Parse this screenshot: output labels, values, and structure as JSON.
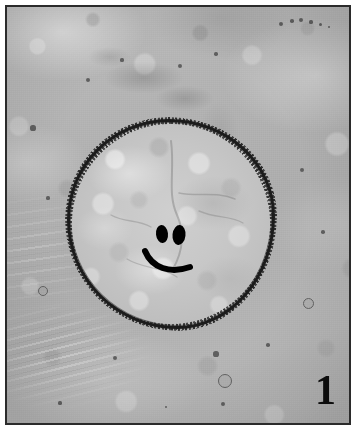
{
  "figure": {
    "number": "1",
    "caption_text": "",
    "medium": "light micrograph, greyscale"
  },
  "image": {
    "width_px": 356,
    "height_px": 430,
    "border_color": "#2b2b2b",
    "page_background": "#ffffff",
    "field_background": "#b3b3b3"
  },
  "subject": {
    "name": "encysted-circular-structure",
    "outline_color": "#1c1c1c",
    "interior_color": "#c6c6c6",
    "bounds": {
      "x": 60,
      "y": 112,
      "w": 208,
      "h": 210
    }
  },
  "markings": {
    "description": "smiley-face",
    "color": "#000000",
    "left_eye": {
      "cx": 160,
      "cy": 232,
      "rx": 6,
      "ry": 9
    },
    "right_eye": {
      "cx": 177,
      "cy": 233,
      "rx": 6.5,
      "ry": 10
    },
    "mouth_path": "M143,249 C150,266 168,272 188,265",
    "mouth_width": 6
  },
  "background_dots": [
    {
      "x": 279,
      "y": 22,
      "r": 2.4
    },
    {
      "x": 290,
      "y": 19,
      "r": 1.8
    },
    {
      "x": 299,
      "y": 18,
      "r": 2.0
    },
    {
      "x": 309,
      "y": 20,
      "r": 1.6
    },
    {
      "x": 318,
      "y": 22,
      "r": 1.5
    },
    {
      "x": 327,
      "y": 25,
      "r": 1.4
    },
    {
      "x": 86,
      "y": 78,
      "r": 2.2
    },
    {
      "x": 120,
      "y": 58,
      "r": 1.6
    },
    {
      "x": 178,
      "y": 64,
      "r": 2.0
    },
    {
      "x": 214,
      "y": 52,
      "r": 1.7
    },
    {
      "x": 31,
      "y": 126,
      "r": 2.6
    },
    {
      "x": 46,
      "y": 196,
      "r": 1.6
    },
    {
      "x": 300,
      "y": 168,
      "r": 2.0
    },
    {
      "x": 321,
      "y": 230,
      "r": 1.8
    },
    {
      "x": 113,
      "y": 356,
      "r": 2.2
    },
    {
      "x": 214,
      "y": 352,
      "r": 2.6
    },
    {
      "x": 221,
      "y": 402,
      "r": 2.0
    },
    {
      "x": 266,
      "y": 343,
      "r": 1.8
    },
    {
      "x": 58,
      "y": 401,
      "r": 1.6
    },
    {
      "x": 164,
      "y": 405,
      "r": 1.4
    }
  ],
  "background_ring_dots": [
    {
      "x": 222,
      "y": 378,
      "r": 6
    },
    {
      "x": 40,
      "y": 288,
      "r": 4
    },
    {
      "x": 305,
      "y": 300,
      "r": 4.5
    }
  ]
}
